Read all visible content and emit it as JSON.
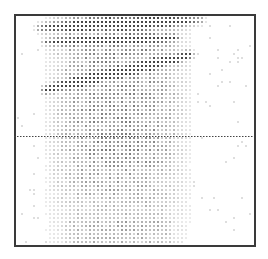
{
  "chart_data": {
    "type": "heatmap",
    "title": "",
    "xlabel": "",
    "ylabel": "",
    "grid": false,
    "legend": null,
    "render_style": "dot-matrix density (halftone)",
    "frame": {
      "x": 14,
      "y": 14,
      "width": 238,
      "height": 229,
      "color": "#3a3a3a"
    },
    "dot_pitch": 4,
    "dense_region": {
      "x_center": 118,
      "x_halfwidth": 80,
      "y_top": 16,
      "y_bottom": 243,
      "left_edge": 40,
      "right_edge": 200
    },
    "bands": [
      {
        "name": "upper-band",
        "from": [
          40,
          28
        ],
        "to": [
          200,
          20
        ],
        "width": 8,
        "intensity": 0.9
      },
      {
        "name": "upper-band-2",
        "from": [
          45,
          42
        ],
        "to": [
          175,
          38
        ],
        "width": 6,
        "intensity": 0.7
      },
      {
        "name": "main-diagonal-band",
        "from": [
          45,
          90
        ],
        "to": [
          190,
          55
        ],
        "width": 7,
        "intensity": 1.0
      }
    ],
    "reference_line": {
      "orientation": "horizontal",
      "y": 136,
      "style": "dotted",
      "x_from": 14,
      "x_to": 254
    },
    "colors": {
      "dot": "#1a1a1a",
      "background": "#ffffff"
    }
  }
}
